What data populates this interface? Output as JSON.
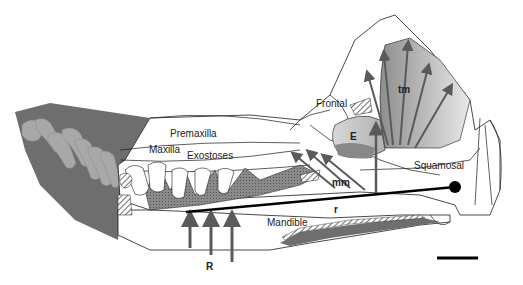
{
  "diagram": {
    "labels": {
      "premaxilla": "Premaxilla",
      "maxilla": "Maxilla",
      "exostoses": "Exostoses",
      "frontal": "Frontal",
      "tm": "tm",
      "e": "E",
      "mm": "mm",
      "squamosal": "Squamosal",
      "r": "r",
      "mandible": "Mandible",
      "R": "R"
    },
    "colors": {
      "outline": "#1a1a1a",
      "rostrum_fill": "#6e6e6e",
      "teeth_fill": "#a8a8a8",
      "muscle_fill": "#9a9a9a",
      "arrow": "#5a5a5a",
      "lever_line": "#000000"
    },
    "scale_bar": true
  }
}
